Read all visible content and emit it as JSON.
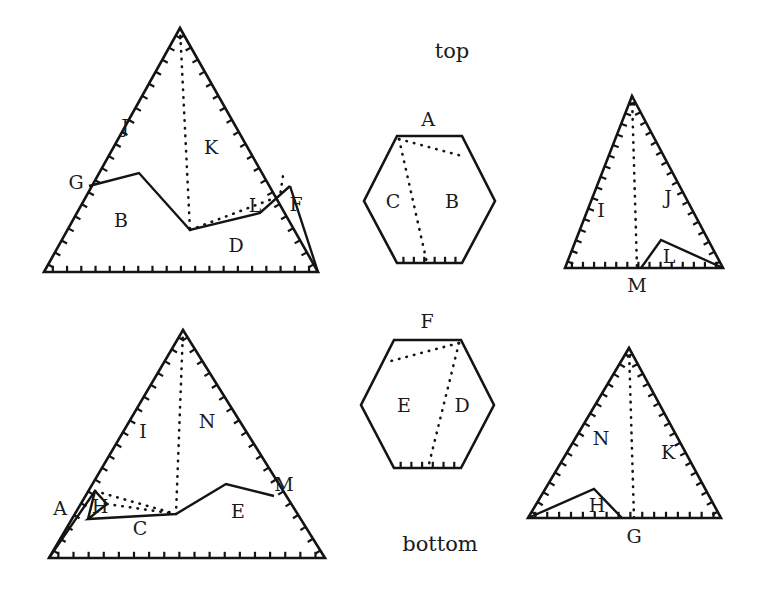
{
  "figure": {
    "title_top": "top",
    "title_bottom": "bottom",
    "background_color": "#ffffff",
    "ink_color": "#141414"
  },
  "annotations": {
    "top_label": {
      "text": "top",
      "x": 452,
      "y": 52
    },
    "bottom_label": {
      "text": "bottom",
      "x": 440,
      "y": 545
    }
  },
  "shapes": [
    {
      "id": "top-left-triangle",
      "kind": "triangle",
      "outline": "44,272 180,28 318,272",
      "hatched_edges": [
        {
          "from": [
            44,
            272
          ],
          "to": [
            180,
            28
          ],
          "count": 20
        },
        {
          "from": [
            180,
            28
          ],
          "to": [
            318,
            272
          ],
          "count": 20
        },
        {
          "from": [
            44,
            272
          ],
          "to": [
            318,
            272
          ],
          "count": 19
        }
      ],
      "solid_paths": [
        "89,186 139,173 190,230 260,213 290,186",
        "290,186 318,272"
      ],
      "dotted_paths": [
        "180,28 190,230",
        "190,230 280,196 283,176"
      ],
      "labels": [
        {
          "text": "J",
          "x": 125,
          "y": 128
        },
        {
          "text": "K",
          "x": 211,
          "y": 149
        },
        {
          "text": "G",
          "x": 76,
          "y": 184
        },
        {
          "text": "B",
          "x": 121,
          "y": 222
        },
        {
          "text": "L",
          "x": 255,
          "y": 207
        },
        {
          "text": "F",
          "x": 296,
          "y": 206
        },
        {
          "text": "D",
          "x": 236,
          "y": 247
        }
      ]
    },
    {
      "id": "top-hexagon",
      "kind": "hexagon",
      "outline": "397,136 462,136 495,201 462,263 397,263 364,201",
      "hatched_edges": [
        {
          "from": [
            397,
            263
          ],
          "to": [
            462,
            263
          ],
          "count": 6
        }
      ],
      "solid_paths": [],
      "dotted_paths": [
        "399,139 462,156",
        "399,139 427,263"
      ],
      "labels": [
        {
          "text": "A",
          "x": 428,
          "y": 121
        },
        {
          "text": "C",
          "x": 393,
          "y": 203
        },
        {
          "text": "B",
          "x": 452,
          "y": 203
        }
      ]
    },
    {
      "id": "top-right-triangle",
      "kind": "triangle",
      "outline": "565,268 632,96 723,268",
      "hatched_edges": [
        {
          "from": [
            565,
            268
          ],
          "to": [
            632,
            96
          ],
          "count": 16
        },
        {
          "from": [
            632,
            96
          ],
          "to": [
            723,
            268
          ],
          "count": 17
        },
        {
          "from": [
            565,
            268
          ],
          "to": [
            723,
            268
          ],
          "count": 14
        }
      ],
      "solid_paths": [
        "641,268 661,240 723,268"
      ],
      "dotted_paths": [
        "632,96 637,268"
      ],
      "labels": [
        {
          "text": "I",
          "x": 601,
          "y": 212
        },
        {
          "text": "J",
          "x": 668,
          "y": 199
        },
        {
          "text": "L",
          "x": 669,
          "y": 258
        },
        {
          "text": "M",
          "x": 637,
          "y": 287
        }
      ]
    },
    {
      "id": "bottom-left-triangle",
      "kind": "triangle",
      "outline": "49,558 183,330 325,558",
      "hatched_edges": [
        {
          "from": [
            49,
            558
          ],
          "to": [
            183,
            330
          ],
          "count": 19
        },
        {
          "from": [
            183,
            330
          ],
          "to": [
            325,
            558
          ],
          "count": 19
        },
        {
          "from": [
            49,
            558
          ],
          "to": [
            325,
            558
          ],
          "count": 18
        }
      ],
      "solid_paths": [
        "49,558 95,491 107,504 88,519 176,514 226,484 274,496",
        "95,491 88,519"
      ],
      "dotted_paths": [
        "183,330 176,514",
        "95,491 176,514",
        "107,504 176,514"
      ],
      "labels": [
        {
          "text": "I",
          "x": 143,
          "y": 433
        },
        {
          "text": "N",
          "x": 207,
          "y": 423
        },
        {
          "text": "A",
          "x": 60,
          "y": 510
        },
        {
          "text": "H",
          "x": 100,
          "y": 508
        },
        {
          "text": "C",
          "x": 140,
          "y": 530
        },
        {
          "text": "E",
          "x": 238,
          "y": 513
        },
        {
          "text": "M",
          "x": 284,
          "y": 486
        }
      ]
    },
    {
      "id": "bottom-hexagon",
      "kind": "hexagon",
      "outline": "394,340 461,340 494,405 461,468 394,468 361,405",
      "hatched_edges": [
        {
          "from": [
            394,
            468
          ],
          "to": [
            461,
            468
          ],
          "count": 6
        }
      ],
      "solid_paths": [],
      "dotted_paths": [
        "459,343 391,361",
        "459,343 428,468"
      ],
      "labels": [
        {
          "text": "F",
          "x": 427,
          "y": 323
        },
        {
          "text": "E",
          "x": 404,
          "y": 407
        },
        {
          "text": "D",
          "x": 462,
          "y": 407
        }
      ]
    },
    {
      "id": "bottom-right-triangle",
      "kind": "triangle",
      "outline": "528,518 629,348 721,518",
      "hatched_edges": [
        {
          "from": [
            528,
            518
          ],
          "to": [
            629,
            348
          ],
          "count": 17
        },
        {
          "from": [
            629,
            348
          ],
          "to": [
            721,
            518
          ],
          "count": 17
        },
        {
          "from": [
            528,
            518
          ],
          "to": [
            721,
            518
          ],
          "count": 16
        }
      ],
      "solid_paths": [
        "528,518 594,489 622,518"
      ],
      "dotted_paths": [
        "629,348 634,518"
      ],
      "labels": [
        {
          "text": "N",
          "x": 601,
          "y": 440
        },
        {
          "text": "K",
          "x": 668,
          "y": 454
        },
        {
          "text": "H",
          "x": 597,
          "y": 507
        },
        {
          "text": "G",
          "x": 634,
          "y": 538
        }
      ]
    }
  ]
}
